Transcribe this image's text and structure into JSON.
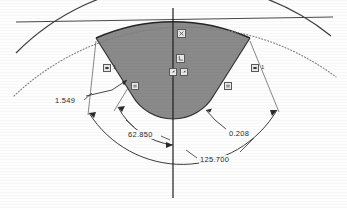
{
  "drawing": {
    "title": "CAD sketch — shaded sector with angular dimensions",
    "colors": {
      "shade_fill": "#8a8a8a",
      "shade_edge": "#2e2e2e",
      "solid_line": "#3a3a3a",
      "dotted_line": "#7d7d7d",
      "axis_line": "#1f1f1f",
      "dim_line": "#303030",
      "text": "#2b2b2b",
      "glyph_fill": "#e8e8e8",
      "glyph_stroke": "#5a5a5a",
      "background": "#fdfdfd"
    },
    "dimensions": [
      {
        "id": "linear-left",
        "value": "1.549",
        "kind": "linear",
        "x": 54,
        "y": 96
      },
      {
        "id": "angle-inner",
        "value": "62.850",
        "kind": "angular",
        "x": 127,
        "y": 130
      },
      {
        "id": "radius-right",
        "value": "0.208",
        "kind": "linear",
        "x": 228,
        "y": 129
      },
      {
        "id": "angle-outer",
        "value": "125.700",
        "kind": "angular",
        "x": 199,
        "y": 155
      }
    ],
    "constraints": [
      {
        "id": "c1",
        "icon": "fix-constraint-icon",
        "x": 177,
        "y": 29,
        "tag": ""
      },
      {
        "id": "c2",
        "icon": "perpendicular-constraint-icon",
        "x": 176,
        "y": 54,
        "tag": ""
      },
      {
        "id": "c3",
        "icon": "coincident-constraint-icon",
        "x": 170,
        "y": 68,
        "tag": ""
      },
      {
        "id": "c4",
        "icon": "coincident-constraint-icon",
        "x": 181,
        "y": 68,
        "tag": ""
      },
      {
        "id": "c5",
        "icon": "tangent-constraint-icon",
        "x": 103,
        "y": 64,
        "tag": "1"
      },
      {
        "id": "c6",
        "icon": "tangent-constraint-icon",
        "x": 251,
        "y": 64,
        "tag": "1"
      },
      {
        "id": "c7",
        "icon": "equal-constraint-icon",
        "x": 131,
        "y": 82,
        "tag": ""
      },
      {
        "id": "c8",
        "icon": "equal-constraint-icon",
        "x": 224,
        "y": 82,
        "tag": ""
      }
    ],
    "geometry_notes": {
      "sector_fill": "grey shaded circular sector open at the top, rounded bottom",
      "top_horizon": "near-horizontal straight line across the top",
      "outer_arc": "solid wide arc crossing the sector shoulders",
      "inner_arc": "dotted wide arc passing below the shoulders",
      "vertical_axis": "centre construction line running top to bottom"
    }
  }
}
